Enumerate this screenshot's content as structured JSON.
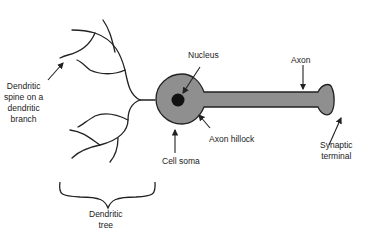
{
  "diagram": {
    "colors": {
      "cell_fill": "#8f8f8f",
      "nucleus": "#111111",
      "stroke": "#222222",
      "background": "#ffffff"
    },
    "labels": {
      "nucleus": "Nucleus",
      "axon": "Axon",
      "dendritic_spine": [
        "Dendritic",
        "spine on a",
        "dendritic",
        "branch"
      ],
      "axon_hillock": "Axon hillock",
      "cell_soma": "Cell soma",
      "synaptic_terminal": [
        "Synaptic",
        "terminal"
      ],
      "dendritic_tree": [
        "Dendritic",
        "tree"
      ]
    }
  }
}
